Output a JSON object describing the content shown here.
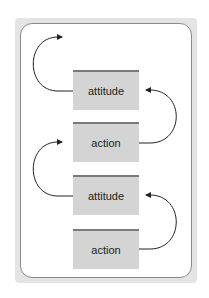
{
  "diagram": {
    "boxes": [
      {
        "label": "attitude"
      },
      {
        "label": "action"
      },
      {
        "label": "attitude"
      },
      {
        "label": "action"
      }
    ],
    "colors": {
      "frame": "#e4e4e4",
      "box_fill": "#d4d4d4",
      "box_top_border": "#7a7a7a",
      "arrow": "#222222"
    }
  }
}
